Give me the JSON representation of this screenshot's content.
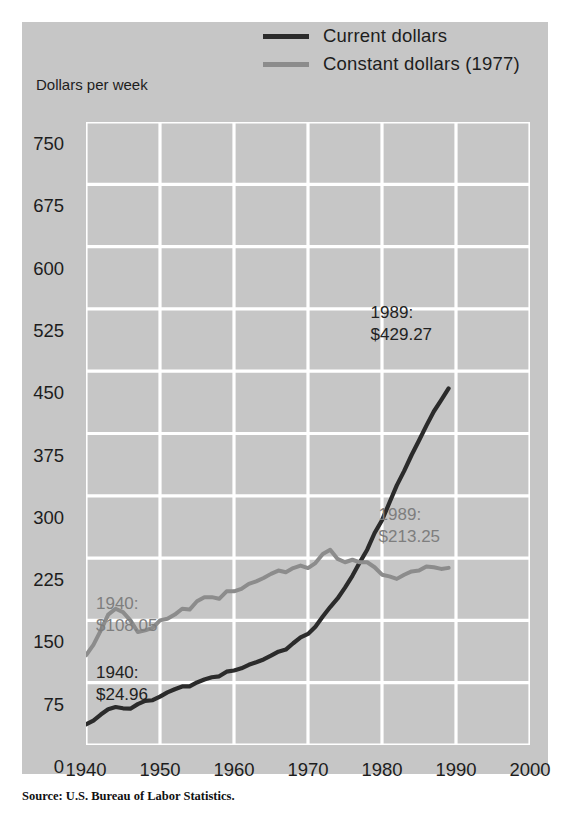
{
  "chart_data": {
    "type": "line",
    "title": "",
    "xlabel": "",
    "ylabel": "Dollars per week",
    "xlim": [
      1940,
      2000
    ],
    "ylim": [
      0,
      750
    ],
    "xticks": [
      1940,
      1950,
      1960,
      1970,
      1980,
      1990,
      2000
    ],
    "yticks": [
      0,
      75,
      150,
      225,
      300,
      375,
      450,
      525,
      600,
      675,
      750
    ],
    "grid": true,
    "legend_position": "top-right",
    "colors": {
      "current": "#2b2b2b",
      "constant": "#8c8c8c",
      "panel": "#c6c6c6",
      "gridline": "#ffffff"
    },
    "series": [
      {
        "name": "Current dollars",
        "color": "#2b2b2b",
        "x": [
          1940,
          1941,
          1942,
          1943,
          1944,
          1945,
          1946,
          1947,
          1948,
          1949,
          1950,
          1951,
          1952,
          1953,
          1954,
          1955,
          1956,
          1957,
          1958,
          1959,
          1960,
          1961,
          1962,
          1963,
          1964,
          1965,
          1966,
          1967,
          1968,
          1969,
          1970,
          1971,
          1972,
          1973,
          1974,
          1975,
          1976,
          1977,
          1978,
          1979,
          1980,
          1981,
          1982,
          1983,
          1984,
          1985,
          1986,
          1987,
          1988,
          1989
        ],
        "values": [
          24.96,
          29.48,
          36.68,
          43.07,
          45.7,
          44.2,
          43.74,
          49.17,
          53.12,
          53.88,
          58.32,
          63.34,
          67.16,
          70.47,
          70.49,
          75.3,
          78.78,
          81.59,
          82.71,
          88.26,
          89.72,
          92.34,
          96.56,
          99.63,
          102.97,
          107.53,
          112.34,
          114.9,
          122.51,
          129.51,
          133.73,
          142.44,
          154.69,
          166.06,
          176.4,
          189.51,
          203.7,
          219.91,
          235.1,
          255.2,
          270.5,
          291.6,
          312.5,
          330.0,
          349.1,
          366.6,
          384.5,
          401.5,
          415.1,
          429.27
        ],
        "endpoints": {
          "start": {
            "year": 1940,
            "value": 24.96
          },
          "end": {
            "year": 1989,
            "value": 429.27
          }
        }
      },
      {
        "name": "Constant dollars (1977)",
        "color": "#8c8c8c",
        "x": [
          1940,
          1941,
          1942,
          1943,
          1944,
          1945,
          1946,
          1947,
          1948,
          1949,
          1950,
          1951,
          1952,
          1953,
          1954,
          1955,
          1956,
          1957,
          1958,
          1959,
          1960,
          1961,
          1962,
          1963,
          1964,
          1965,
          1966,
          1967,
          1968,
          1969,
          1970,
          1971,
          1972,
          1973,
          1974,
          1975,
          1976,
          1977,
          1978,
          1979,
          1980,
          1981,
          1982,
          1983,
          1984,
          1985,
          1986,
          1987,
          1988,
          1989
        ],
        "values": [
          108.05,
          120.5,
          138.0,
          157.0,
          164.0,
          160.0,
          150.0,
          136.0,
          138.0,
          141.0,
          150.0,
          152.0,
          157.0,
          164.0,
          163.0,
          173.0,
          178.0,
          178.0,
          176.0,
          185.0,
          185.0,
          188.0,
          194.0,
          197.0,
          201.0,
          206.0,
          210.0,
          208.0,
          213.0,
          216.0,
          213.0,
          219.0,
          230.0,
          235.0,
          224.0,
          220.0,
          223.0,
          219.91,
          220.0,
          214.0,
          205.0,
          203.0,
          200.0,
          205.0,
          209.0,
          210.0,
          215.0,
          214.0,
          212.0,
          213.25
        ],
        "endpoints": {
          "start": {
            "year": 1940,
            "value": 108.05
          },
          "end": {
            "year": 1989,
            "value": 213.25
          }
        }
      }
    ],
    "annotations": [
      {
        "id": "current-1940",
        "text": "1940:\n$24.96",
        "color": "dark",
        "year": 1940,
        "value": 24.96
      },
      {
        "id": "constant-1940",
        "text": "1940:\n$108.05",
        "color": "gray",
        "year": 1940,
        "value": 108.05
      },
      {
        "id": "current-1989",
        "text": "1989:\n$429.27",
        "color": "dark",
        "year": 1989,
        "value": 429.27
      },
      {
        "id": "constant-1989",
        "text": "1989:\n$213.25",
        "color": "gray",
        "year": 1989,
        "value": 213.25
      }
    ]
  },
  "legend": {
    "items": [
      {
        "label": "Current dollars",
        "swatch": "dark"
      },
      {
        "label": "Constant dollars (1977)",
        "swatch": "gray"
      }
    ]
  },
  "axis": {
    "y_label": "Dollars per week",
    "y_ticks": [
      "750",
      "675",
      "600",
      "525",
      "450",
      "375",
      "300",
      "225",
      "150",
      "75",
      "0"
    ],
    "x_ticks": [
      "1940",
      "1950",
      "1960",
      "1970",
      "1980",
      "1990",
      "2000"
    ]
  },
  "annotations": {
    "constant_1940_line1": "1940:",
    "constant_1940_line2": "$108.05",
    "current_1940_line1": "1940:",
    "current_1940_line2": "$24.96",
    "current_1989_line1": "1989:",
    "current_1989_line2": "$429.27",
    "constant_1989_line1": "1989:",
    "constant_1989_line2": "$213.25"
  },
  "source": "Source: U.S. Bureau of Labor Statistics."
}
